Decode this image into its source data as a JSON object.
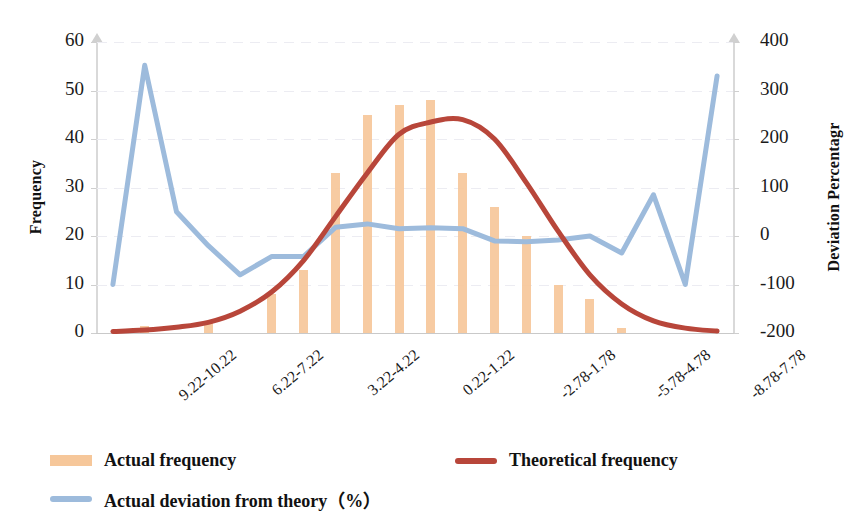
{
  "axes": {
    "y_left_title": "Frequency",
    "y_right_title": "Deviation Percentagr",
    "y_left_ticks": [
      "60",
      "50",
      "40",
      "30",
      "20",
      "10",
      "0"
    ],
    "y_right_ticks": [
      "400",
      "300",
      "200",
      "100",
      "0",
      "-100",
      "-200"
    ]
  },
  "legend": {
    "actual": "Actual frequency",
    "theoretical": "Theoretical frequency",
    "deviation": "Actual deviation from theory（%）"
  },
  "colors": {
    "bar": "#f6c79a",
    "theoretical_line": "#b8463a",
    "deviation_line": "#9dbbdc",
    "axis": "#d9d9d9",
    "grid": "#ececf2",
    "text": "#1a1a1a"
  },
  "chart_data": {
    "type": "bar",
    "title": "",
    "xlabel": "",
    "ylabel": "Frequency",
    "y2label": "Deviation Percentagr",
    "ylim": [
      0,
      60
    ],
    "y2lim": [
      -200,
      400
    ],
    "grid": true,
    "legend_position": "bottom-left",
    "categories": [
      "9.22-10.22",
      "",
      "",
      "6.22-7.22",
      "",
      "",
      "3.22-4.22",
      "",
      "",
      "0.22-1.22",
      "",
      "",
      "-2.78-1.78",
      "",
      "",
      "-5.78-4.78",
      "",
      "",
      "-8.78-7.78",
      ""
    ],
    "visible_tick_labels": [
      {
        "index": 0,
        "label": "9.22-10.22"
      },
      {
        "index": 3,
        "label": "6.22-7.22"
      },
      {
        "index": 6,
        "label": "3.22-4.22"
      },
      {
        "index": 9,
        "label": "0.22-1.22"
      },
      {
        "index": 12,
        "label": "-2.78-1.78"
      },
      {
        "index": 15,
        "label": "-5.78-4.78"
      },
      {
        "index": 18,
        "label": "-8.78-7.78"
      }
    ],
    "series": [
      {
        "name": "Actual frequency",
        "type": "bar",
        "axis": "left",
        "color": "#f6c79a",
        "values": [
          0,
          1.5,
          0,
          2,
          0,
          8,
          13,
          33,
          45,
          47,
          48,
          33,
          26,
          20,
          10,
          7,
          1,
          0,
          0,
          0
        ]
      },
      {
        "name": "Theoretical frequency",
        "type": "line",
        "axis": "left",
        "color": "#b8463a",
        "values": [
          0.3,
          0.6,
          1.2,
          2.2,
          4.5,
          8.5,
          15,
          24,
          33,
          41,
          43.5,
          44,
          40,
          31,
          21,
          12,
          6,
          2.5,
          1,
          0.4
        ]
      },
      {
        "name": "Actual deviation from theory（%）",
        "type": "line",
        "axis": "right",
        "color": "#9dbbdc",
        "values": [
          -100,
          352,
          50,
          -20,
          -80,
          -42,
          -42,
          18,
          25,
          15,
          17,
          15,
          -10,
          -12,
          -8,
          0,
          -35,
          85,
          -100,
          330
        ]
      }
    ]
  }
}
